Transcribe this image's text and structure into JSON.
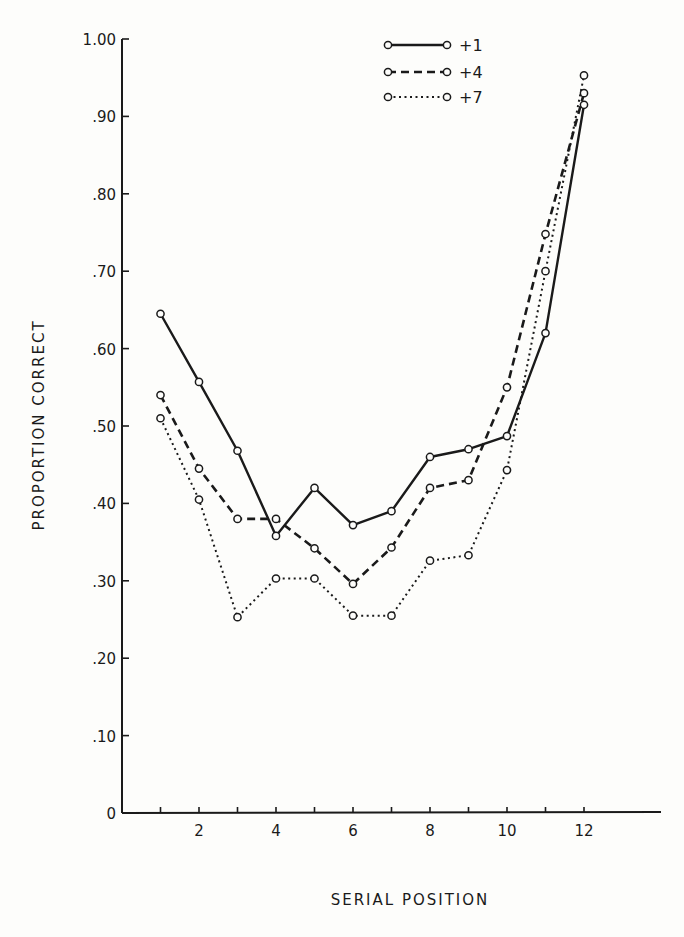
{
  "chart_data": {
    "type": "line",
    "title": "",
    "xlabel": "SERIAL POSITION",
    "ylabel": "PROPORTION CORRECT",
    "x": [
      1,
      2,
      3,
      4,
      5,
      6,
      7,
      8,
      9,
      10,
      11,
      12
    ],
    "x_tick_labels": [
      "2",
      "4",
      "6",
      "8",
      "10",
      "12"
    ],
    "x_tick_values": [
      2,
      4,
      6,
      8,
      10,
      12
    ],
    "xlim": [
      0,
      14
    ],
    "y_tick_labels": [
      "0",
      ".10",
      ".20",
      ".30",
      ".40",
      ".50",
      ".60",
      ".70",
      ".80",
      ".90",
      "1.00"
    ],
    "y_tick_values": [
      0,
      0.1,
      0.2,
      0.3,
      0.4,
      0.5,
      0.6,
      0.7,
      0.8,
      0.9,
      1.0
    ],
    "ylim": [
      0,
      1.0
    ],
    "grid": false,
    "legend_position": "upper right",
    "series": [
      {
        "name": "+1",
        "style": "solid",
        "values": [
          0.645,
          0.557,
          0.468,
          0.358,
          0.42,
          0.372,
          0.39,
          0.46,
          0.47,
          0.487,
          0.62,
          0.915
        ]
      },
      {
        "name": "+4",
        "style": "dashed",
        "values": [
          0.54,
          0.445,
          0.38,
          0.38,
          0.342,
          0.296,
          0.343,
          0.42,
          0.43,
          0.55,
          0.748,
          0.93
        ]
      },
      {
        "name": "+7",
        "style": "dotted",
        "values": [
          0.51,
          0.405,
          0.253,
          0.303,
          0.303,
          0.255,
          0.255,
          0.326,
          0.333,
          0.443,
          0.7,
          0.953
        ]
      }
    ]
  },
  "legend": {
    "items": [
      {
        "label": "+1"
      },
      {
        "label": "+4"
      },
      {
        "label": "+7"
      }
    ]
  },
  "axes": {
    "x_title": "SERIAL POSITION",
    "y_title": "PROPORTION CORRECT"
  }
}
